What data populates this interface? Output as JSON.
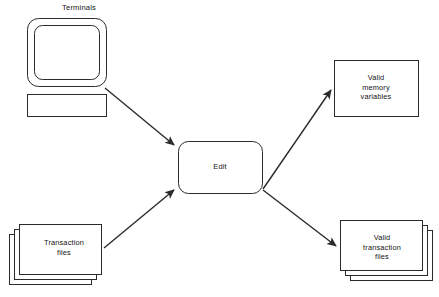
{
  "diagram": {
    "caption": "Terminals",
    "stroke_color": "#2b2b2b",
    "fill_color": "#ffffff",
    "text_color": "#141414",
    "background": "#ffffff",
    "nodes": [
      {
        "id": "terminal",
        "shape": "terminal",
        "label": "",
        "caption": "Terminals"
      },
      {
        "id": "transaction-files",
        "shape": "document-stack",
        "label": "Transaction\nfiles"
      },
      {
        "id": "edit",
        "shape": "rounded-rectangle",
        "label": "Edit"
      },
      {
        "id": "valid-memory-variables",
        "shape": "rectangle",
        "label": "Valid\nmemory\nvariables"
      },
      {
        "id": "valid-transaction-files",
        "shape": "document-stack",
        "label": "Valid\ntransaction\nfiles"
      }
    ],
    "edges": [
      {
        "id": "terminal-to-edit",
        "from": "terminal",
        "to": "edit",
        "direction": "down-right",
        "arrowhead": "end"
      },
      {
        "id": "transaction-to-edit",
        "from": "transaction-files",
        "to": "edit",
        "direction": "up-right",
        "arrowhead": "end"
      },
      {
        "id": "edit-to-memory",
        "from": "edit",
        "to": "valid-memory-variables",
        "direction": "up-right",
        "arrowhead": "end"
      },
      {
        "id": "edit-to-valid-transaction",
        "from": "edit",
        "to": "valid-transaction-files",
        "direction": "down-right",
        "arrowhead": "end"
      }
    ]
  }
}
